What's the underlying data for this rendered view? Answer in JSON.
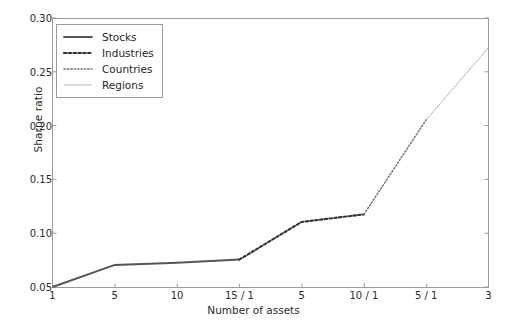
{
  "figure": {
    "background": "#ffffff",
    "axes_color": "#808080",
    "text_color": "#2b2b2b"
  },
  "legend": {
    "position": "upper-left",
    "entries": [
      {
        "label": "Stocks",
        "style": "solid",
        "color": "#555555",
        "icon": "line-solid-icon"
      },
      {
        "label": "Industries",
        "style": "dashed",
        "color": "#333333",
        "icon": "line-dashed-icon"
      },
      {
        "label": "Countries",
        "style": "dotted",
        "color": "#777777",
        "icon": "line-dotted-icon"
      },
      {
        "label": "Regions",
        "style": "fine-dotted",
        "color": "#999999",
        "icon": "line-fine-dotted-icon"
      }
    ]
  },
  "axes": {
    "xlabel": "Number of assets",
    "ylabel": "Sharpe ratio",
    "xticks": [
      "1",
      "5",
      "10",
      "15 / 1",
      "5",
      "10 / 1",
      "5 / 1",
      "3"
    ],
    "yticks": [
      "0.05",
      "0.10",
      "0.15",
      "0.20",
      "0.25",
      "0.30"
    ]
  },
  "chart_data": {
    "type": "line",
    "title": "",
    "xlabel": "Number of assets",
    "ylabel": "Sharpe ratio",
    "xlim": [
      0,
      7
    ],
    "ylim": [
      0.05,
      0.3
    ],
    "grid": false,
    "legend_position": "upper left",
    "xtick_positions": [
      0,
      1,
      2,
      3,
      4,
      5,
      6,
      7
    ],
    "xtick_labels": [
      "1",
      "5",
      "10",
      "15 / 1",
      "5",
      "10 / 1",
      "5 / 1",
      "3"
    ],
    "ytick_values": [
      0.05,
      0.1,
      0.15,
      0.2,
      0.25,
      0.3
    ],
    "series": [
      {
        "name": "Stocks",
        "style": "solid",
        "color": "#555555",
        "x": [
          0,
          1,
          2,
          3
        ],
        "x_labels": [
          "1",
          "5",
          "10",
          "15"
        ],
        "values": [
          0.05,
          0.0705,
          0.0725,
          0.0755
        ]
      },
      {
        "name": "Industries",
        "style": "dashed",
        "color": "#333333",
        "x": [
          3,
          4,
          5
        ],
        "x_labels": [
          "1",
          "5",
          "10"
        ],
        "values": [
          0.0755,
          0.1105,
          0.1175
        ]
      },
      {
        "name": "Countries",
        "style": "dotted",
        "color": "#777777",
        "x": [
          5,
          6
        ],
        "x_labels": [
          "1",
          "5"
        ],
        "values": [
          0.1175,
          0.2055
        ]
      },
      {
        "name": "Regions",
        "style": "fine-dotted",
        "color": "#999999",
        "x": [
          6,
          7
        ],
        "x_labels": [
          "1",
          "3"
        ],
        "values": [
          0.2055,
          0.2725
        ]
      }
    ]
  }
}
